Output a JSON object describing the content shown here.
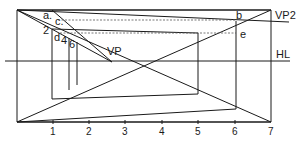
{
  "diagram": {
    "labels": {
      "vp": "VP",
      "vp2": "VP2",
      "hl": "HL",
      "a": "a.",
      "b": "b",
      "c": "c.",
      "d": "d",
      "e": "e",
      "n2": "2",
      "n4": "4",
      "n6": "6"
    },
    "scale_ticks": [
      "1",
      "2",
      "3",
      "4",
      "5",
      "6",
      "7"
    ],
    "colors": {
      "line": "#1a1a1a",
      "dashed": "#555555",
      "background": "#ffffff"
    }
  }
}
